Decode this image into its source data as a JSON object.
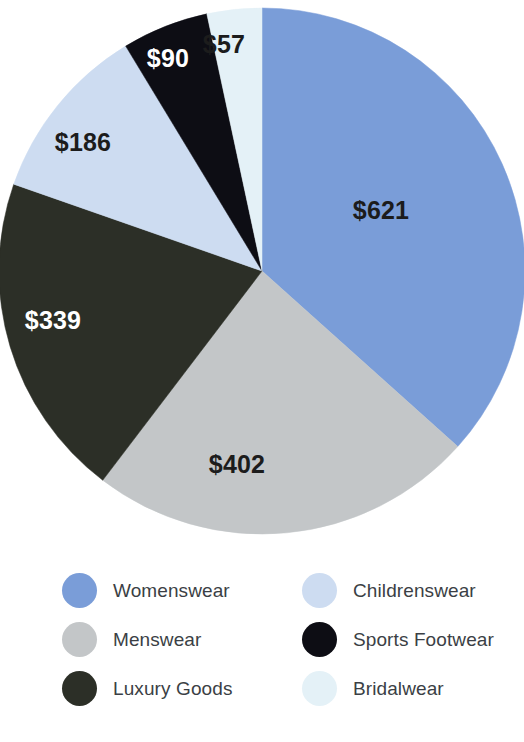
{
  "chart_data": {
    "type": "pie",
    "title": "",
    "subtitle": "",
    "xlabel": "",
    "ylabel": "",
    "currency_prefix": "$",
    "total": 1695,
    "start_angle_deg": 0,
    "direction": "clockwise",
    "legend_position": "bottom",
    "grid": false,
    "categories": [
      "Womenswear",
      "Menswear",
      "Luxury Goods",
      "Childrenswear",
      "Sports Footwear",
      "Bridalwear"
    ],
    "values": [
      621,
      402,
      339,
      186,
      90,
      57
    ],
    "labels": [
      "$621",
      "$402",
      "$339",
      "$186",
      "$90",
      "$57"
    ],
    "colors": [
      "#7a9dd8",
      "#c3c6c8",
      "#2c2f27",
      "#cddcf1",
      "#0d0d14",
      "#e4f1f7"
    ],
    "label_colors": [
      "#1c1c1c",
      "#1c1c1c",
      "#ffffff",
      "#1c1c1c",
      "#ffffff",
      "#1c1c1c"
    ],
    "slices": [
      {
        "name": "Womenswear",
        "value": 621,
        "label": "$621",
        "color": "#7a9dd8",
        "label_color": "#1c1c1c",
        "label_x": 381,
        "label_y": 212
      },
      {
        "name": "Menswear",
        "value": 402,
        "label": "$402",
        "color": "#c3c6c8",
        "label_color": "#1c1c1c",
        "label_x": 237,
        "label_y": 466
      },
      {
        "name": "Luxury Goods",
        "value": 339,
        "label": "$339",
        "color": "#2c2f27",
        "label_color": "#ffffff",
        "label_x": 53,
        "label_y": 322
      },
      {
        "name": "Childrenswear",
        "value": 186,
        "label": "$186",
        "color": "#cddcf1",
        "label_color": "#1c1c1c",
        "label_x": 83,
        "label_y": 144
      },
      {
        "name": "Sports Footwear",
        "value": 90,
        "label": "$90",
        "color": "#0d0d14",
        "label_color": "#ffffff",
        "label_x": 168,
        "label_y": 60
      },
      {
        "name": "Bridalwear",
        "value": 57,
        "label": "$57",
        "color": "#e4f1f7",
        "label_color": "#1c1c1c",
        "label_x": 224,
        "label_y": 46
      }
    ],
    "geometry": {
      "cx": 262,
      "cy": 271,
      "r": 263
    }
  },
  "legend": {
    "items": [
      {
        "label": "Womenswear",
        "color": "#7a9dd8"
      },
      {
        "label": "Childrenswear",
        "color": "#cddcf1"
      },
      {
        "label": "Menswear",
        "color": "#c3c6c8"
      },
      {
        "label": "Sports Footwear",
        "color": "#0d0d14"
      },
      {
        "label": "Luxury Goods",
        "color": "#2c2f27"
      },
      {
        "label": "Bridalwear",
        "color": "#e4f1f7"
      }
    ]
  }
}
